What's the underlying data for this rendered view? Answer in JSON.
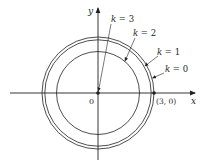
{
  "diagram": {
    "type": "level-curves",
    "axes": {
      "x_label": "x",
      "y_label": "y",
      "origin_label": "0",
      "point_label": "(3, 0)"
    },
    "curves": [
      {
        "label": "k = 0",
        "k": 0,
        "radius": 3
      },
      {
        "label": "k = 1",
        "k": 1,
        "radius": 2.85
      },
      {
        "label": "k = 2",
        "k": 2,
        "radius": 2.25
      },
      {
        "label": "k = 3",
        "k": 3,
        "radius": 0
      }
    ],
    "marked_points": [
      {
        "label": "0",
        "x": 0,
        "y": 0
      },
      {
        "label": "(3, 0)",
        "x": 3,
        "y": 0
      }
    ],
    "colors": {
      "stroke": "#231f20",
      "background": "#ffffff"
    }
  }
}
